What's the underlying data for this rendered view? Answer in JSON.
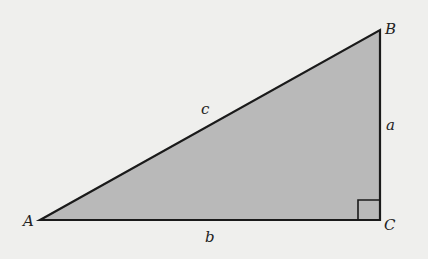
{
  "diagram": {
    "colors": {
      "background": "#efefed",
      "fill": "#b9b9b9",
      "stroke": "#1a1a1a"
    },
    "vertices": [
      {
        "label": "A",
        "x": 40,
        "y": 220
      },
      {
        "label": "B",
        "x": 380,
        "y": 30
      },
      {
        "label": "C",
        "x": 380,
        "y": 220
      }
    ],
    "sides": [
      {
        "label": "c",
        "between": "A-B"
      },
      {
        "label": "a",
        "between": "B-C"
      },
      {
        "label": "b",
        "between": "A-C"
      }
    ],
    "right_angle_at": "C"
  }
}
